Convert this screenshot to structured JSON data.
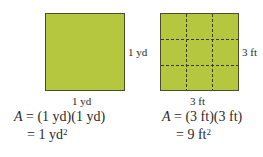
{
  "left_figure": {
    "side_label_right": "1 yd",
    "side_label_bottom": "1 yd",
    "equation_line1_var": "A",
    "equation_line1_rest": " = (1 yd)(1 yd)",
    "equation_line2": "= 1 yd",
    "equation_line2_exp": "2"
  },
  "right_figure": {
    "side_label_right": "3 ft",
    "side_label_bottom": "3 ft",
    "equation_line1_var": "A",
    "equation_line1_rest": " = (3 ft)(3 ft)",
    "equation_line2": "= 9 ft",
    "equation_line2_exp": "2",
    "grid_divisions": 3
  },
  "colors": {
    "fill": "#b5c63f",
    "border": "#4a4f2a",
    "dash": "#3a3a1a"
  }
}
